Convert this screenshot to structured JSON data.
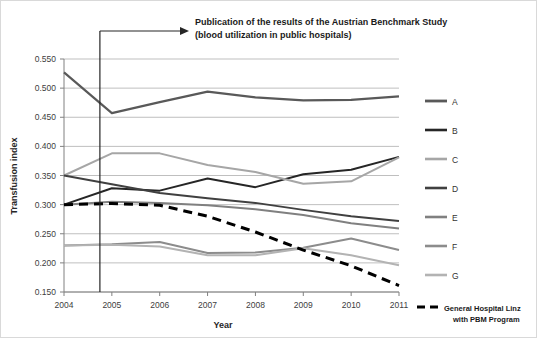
{
  "chart_data": {
    "type": "line",
    "title": "",
    "xlabel": "Year",
    "ylabel": "Transfusion index",
    "x": [
      2004,
      2005,
      2006,
      2007,
      2008,
      2009,
      2010,
      2011
    ],
    "xtick_labels": [
      "2004",
      "2005",
      "2006",
      "2007",
      "2008",
      "2009",
      "2010",
      "2011"
    ],
    "ytick_labels": [
      "0.150",
      "0.200",
      "0.250",
      "0.300",
      "0.350",
      "0.400",
      "0.450",
      "0.500",
      "0.550"
    ],
    "ylim": [
      0.15,
      0.55
    ],
    "ytick_step": 0.05,
    "grid": "horizontal",
    "legend_position": "right",
    "series": [
      {
        "name": "A",
        "color": "#595959",
        "style": "solid",
        "width": 2.2,
        "values": [
          0.527,
          0.457,
          0.476,
          0.494,
          0.484,
          0.479,
          0.48,
          0.486
        ]
      },
      {
        "name": "B",
        "color": "#262626",
        "style": "solid",
        "width": 2.0,
        "values": [
          0.3,
          0.328,
          0.324,
          0.345,
          0.33,
          0.352,
          0.36,
          0.382
        ]
      },
      {
        "name": "C",
        "color": "#a6a6a6",
        "style": "solid",
        "width": 2.0,
        "values": [
          0.35,
          0.388,
          0.388,
          0.368,
          0.356,
          0.336,
          0.34,
          0.381
        ]
      },
      {
        "name": "D",
        "color": "#404040",
        "style": "solid",
        "width": 2.0,
        "values": [
          0.35,
          0.335,
          0.32,
          0.311,
          0.303,
          0.291,
          0.28,
          0.272
        ]
      },
      {
        "name": "E",
        "color": "#808080",
        "style": "solid",
        "width": 2.0,
        "values": [
          0.3,
          0.305,
          0.303,
          0.299,
          0.292,
          0.282,
          0.268,
          0.259
        ]
      },
      {
        "name": "F",
        "color": "#8c8c8c",
        "style": "solid",
        "width": 2.0,
        "values": [
          0.23,
          0.232,
          0.236,
          0.217,
          0.218,
          0.226,
          0.242,
          0.222
        ]
      },
      {
        "name": "G",
        "color": "#b3b3b3",
        "style": "solid",
        "width": 2.0,
        "values": [
          0.23,
          0.231,
          0.228,
          0.213,
          0.213,
          0.225,
          0.213,
          0.196
        ]
      },
      {
        "name": "General Hospital Linz with PBM Program",
        "color": "#000000",
        "style": "dashed",
        "width": 3.0,
        "values": [
          0.3,
          0.302,
          0.299,
          0.28,
          0.253,
          0.222,
          0.195,
          0.161
        ]
      }
    ],
    "annotation": {
      "line1": "Publication of the results of the Austrian Benchmark Study",
      "line2": "(blood utilization in public hospitals)",
      "marker_x": 2004.75,
      "marker_type": "vertical-line-with-arrow"
    }
  },
  "legend": {
    "entries": [
      {
        "label": "A"
      },
      {
        "label": "B"
      },
      {
        "label": "C"
      },
      {
        "label": "D"
      },
      {
        "label": "E"
      },
      {
        "label": "F"
      },
      {
        "label": "G"
      }
    ],
    "pbm_line1": "General Hospital Linz",
    "pbm_line2": "with PBM Program"
  },
  "colors": {
    "gridline": "#bfbfbf",
    "axis": "#808080",
    "border": "#d9d9d9",
    "text": "#333333"
  }
}
